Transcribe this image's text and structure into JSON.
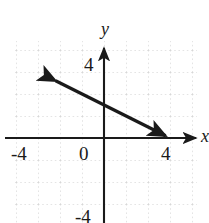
{
  "figure": {
    "background_color": "#ffffff",
    "ink_color": "#1a1a1a",
    "grid_color": "#c9c9c9"
  },
  "axes": {
    "x_name": "x",
    "y_name": "y",
    "origin_label": "0",
    "x_ticks": [
      {
        "label": "-4",
        "value": -4
      },
      {
        "label": "4",
        "value": 4
      }
    ],
    "y_ticks": [
      {
        "label": "4",
        "value": 4
      },
      {
        "label": "-4",
        "value": -4
      }
    ]
  },
  "chart_data": {
    "type": "line",
    "title": "",
    "xlabel": "x",
    "ylabel": "y",
    "xlim": [
      -5.5,
      5.8
    ],
    "ylim": [
      -5.1,
      5.8
    ],
    "grid": true,
    "grid_style": "dotted",
    "grid_spacing": 2,
    "legend": "none",
    "series": [
      {
        "name": "line",
        "equation": "y = -0.5x + 3",
        "slope": -0.5,
        "intercept": 3,
        "arrow_start": true,
        "arrow_end": true,
        "x": [
          -4.4,
          5.6
        ],
        "y": [
          5.2,
          0.2
        ]
      }
    ],
    "annotations": []
  }
}
